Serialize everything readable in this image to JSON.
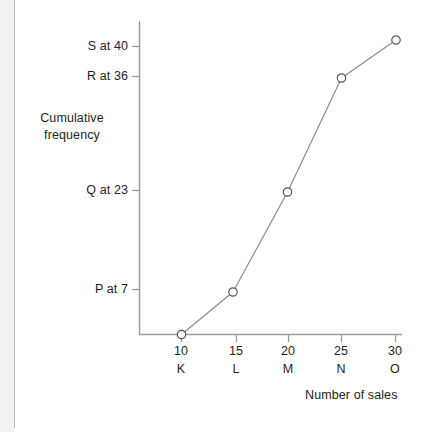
{
  "chart_data": {
    "type": "line",
    "title": "",
    "subtitle": "",
    "xlabel": "Number of sales",
    "ylabel": "Cumulative frequency",
    "ylabel_line1": "Cumulative",
    "ylabel_line2": "frequency",
    "grid": false,
    "legend": "none",
    "xlim": [
      8,
      31
    ],
    "ylim": [
      0,
      43
    ],
    "x_tick_values": [
      10,
      15,
      20,
      25,
      30
    ],
    "x_tick_labels": [
      "10",
      "15",
      "20",
      "25",
      "30"
    ],
    "x_tick_letters": [
      "K",
      "L",
      "M",
      "N",
      "O"
    ],
    "y_tick_values": [
      7,
      23,
      36,
      40
    ],
    "y_tick_labels": [
      "P at 7",
      "Q at 23",
      "R at 36",
      "S at 40"
    ],
    "series": [
      {
        "name": "Cumulative frequency",
        "marker": "open-circle",
        "line_color": "#8c8c8c",
        "marker_color": "#555555",
        "points": [
          {
            "label": "K",
            "x": 10,
            "y": 0
          },
          {
            "label": "L",
            "x": 15,
            "y": 7
          },
          {
            "label": "M",
            "x": 20,
            "y": 23
          },
          {
            "label": "N",
            "x": 25,
            "y": 36
          },
          {
            "label": "O",
            "x": 30,
            "y": 40
          }
        ],
        "x": [
          10,
          15,
          20,
          25,
          30
        ],
        "values": [
          0,
          7,
          23,
          36,
          40
        ]
      }
    ]
  },
  "axes": {
    "y_axis_line_color": "#9a9a9a",
    "x_axis_line_color": "#9a9a9a",
    "tick_color": "#9a9a9a"
  },
  "colors": {
    "background": "#ffffff",
    "text": "#231f20",
    "line": "#8c8c8c",
    "marker_stroke": "#555555",
    "page_edge": "#b9b9b9"
  },
  "y_ticks": [
    {
      "label": "S at 40",
      "value": 40
    },
    {
      "label": "R at 36",
      "value": 36
    },
    {
      "label": "Q at 23",
      "value": 23
    },
    {
      "label": "P at 7",
      "value": 7
    }
  ],
  "x_ticks": [
    {
      "number": "10",
      "letter": "K",
      "value": 10
    },
    {
      "number": "15",
      "letter": "L",
      "value": 15
    },
    {
      "number": "20",
      "letter": "M",
      "value": 20
    },
    {
      "number": "25",
      "letter": "N",
      "value": 25
    },
    {
      "number": "30",
      "letter": "O",
      "value": 30
    }
  ]
}
